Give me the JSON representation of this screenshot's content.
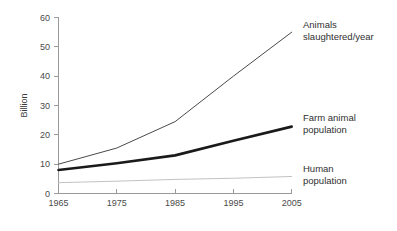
{
  "chart_data": {
    "type": "line",
    "title": "",
    "xlabel": "",
    "ylabel": "Billion",
    "x": [
      1965,
      1975,
      1985,
      1995,
      2005
    ],
    "xtick_labels": [
      "1965",
      "1975",
      "1985",
      "1995",
      "2005"
    ],
    "ytick_labels": [
      "0",
      "10",
      "20",
      "30",
      "40",
      "50",
      "60"
    ],
    "ytick_values": [
      0,
      10,
      20,
      30,
      40,
      50,
      60
    ],
    "xlim": [
      1965,
      2005
    ],
    "ylim": [
      0,
      60
    ],
    "grid": false,
    "legend_position": "right-inline-annotations",
    "series": [
      {
        "name": "Animals slaughtered/year",
        "label_line1": "Animals",
        "label_line2": "slaughtered/year",
        "values": [
          10,
          15.5,
          24.5,
          40,
          55
        ],
        "color": "#4a4a4a",
        "width": 1
      },
      {
        "name": "Farm animal population",
        "label_line1": "Farm animal",
        "label_line2": "population",
        "values": [
          8,
          10.3,
          13,
          18,
          22.8
        ],
        "color": "#1a1a1a",
        "width": 2.6
      },
      {
        "name": "Human population",
        "label_line1": "Human",
        "label_line2": "population",
        "values": [
          3.7,
          4.2,
          4.8,
          5.2,
          5.8
        ],
        "color": "#c2c2c2",
        "width": 1
      }
    ]
  },
  "annotations": {
    "animals_slaughtered": {
      "line1": "Animals",
      "line2": "slaughtered/year"
    },
    "farm_animal": {
      "line1": "Farm animal",
      "line2": "population"
    },
    "human": {
      "line1": "Human",
      "line2": "population"
    }
  },
  "axes": {
    "y_title": "Billion",
    "y_ticks": [
      "60",
      "50",
      "40",
      "30",
      "20",
      "10",
      "0"
    ],
    "x_ticks": [
      "1965",
      "1975",
      "1985",
      "1995",
      "2005"
    ]
  },
  "colors": {
    "background": "#ffffff",
    "axis": "#9a9a9a",
    "text": "#3a3a3a",
    "series_thin_dark": "#4a4a4a",
    "series_thick_black": "#1a1a1a",
    "series_light_gray": "#c2c2c2"
  }
}
